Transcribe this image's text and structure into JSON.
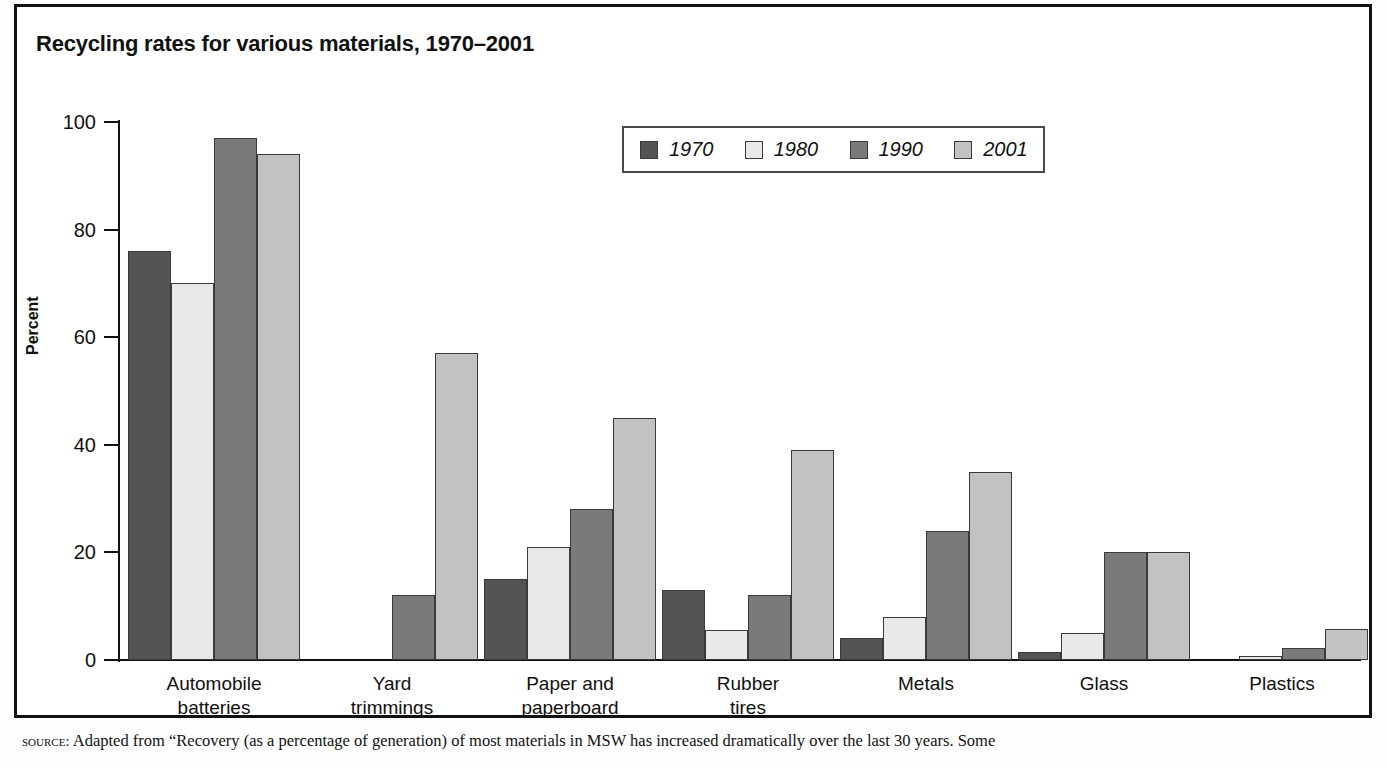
{
  "title": "Recycling rates for various materials, 1970–2001",
  "source_label": "source:",
  "source_text": " Adapted from “Recovery (as a percentage of generation) of most materials in MSW has increased dramatically over the last 30 years. Some",
  "colors": {
    "series_1970": "#545454",
    "series_1980": "#e9e9e9",
    "series_1990": "#7a7a7a",
    "series_2001": "#c2c2c2",
    "axis": "#111111",
    "frame": "#111111",
    "background": "#ffffff"
  },
  "chart_data": {
    "type": "bar",
    "title": "Recycling rates for various materials, 1970–2001",
    "xlabel": "",
    "ylabel": "Percent",
    "ylim": [
      0,
      100
    ],
    "yticks": [
      0,
      20,
      40,
      60,
      80,
      100
    ],
    "ytick_labels": [
      "0",
      "20",
      "40",
      "60",
      "80",
      "100"
    ],
    "grid": false,
    "legend_position": "top-center",
    "categories": [
      "Automobile batteries",
      "Yard trimmings",
      "Paper and paperboard",
      "Rubber tires",
      "Metals",
      "Glass",
      "Plastics"
    ],
    "category_lines": [
      [
        "Automobile",
        "batteries"
      ],
      [
        "Yard",
        "trimmings"
      ],
      [
        "Paper and",
        "paperboard"
      ],
      [
        "Rubber",
        "tires"
      ],
      [
        "Metals"
      ],
      [
        "Glass"
      ],
      [
        "Plastics"
      ]
    ],
    "series": [
      {
        "name": "1970",
        "color": "#545454",
        "values": [
          76,
          0,
          15,
          13,
          4,
          1.5,
          0
        ]
      },
      {
        "name": "1980",
        "color": "#e9e9e9",
        "values": [
          70,
          0,
          21,
          5.5,
          8,
          5,
          0.7
        ]
      },
      {
        "name": "1990",
        "color": "#7a7a7a",
        "values": [
          97,
          12,
          28,
          12,
          24,
          20,
          2.2
        ]
      },
      {
        "name": "2001",
        "color": "#c2c2c2",
        "values": [
          94,
          57,
          45,
          39,
          35,
          20,
          5.7
        ]
      }
    ]
  }
}
